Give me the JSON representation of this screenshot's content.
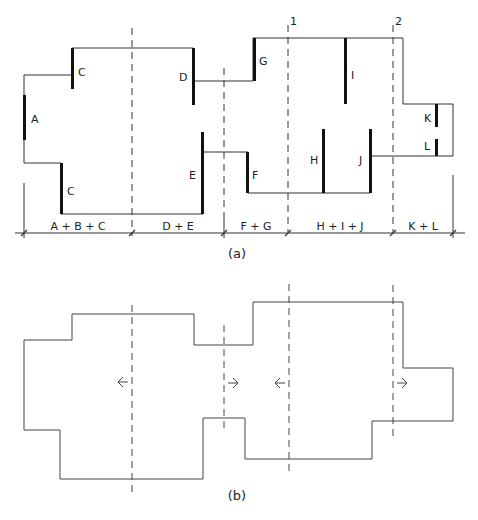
{
  "figure_a": {
    "caption": "(a)",
    "wall_labels": {
      "A": "A",
      "C1": "C",
      "C2": "C",
      "D": "D",
      "E": "E",
      "F": "F",
      "G": "G",
      "H": "H",
      "I": "I",
      "J": "J",
      "K": "K",
      "L": "L"
    },
    "axis_labels": {
      "axis1": "1",
      "axis2": "2"
    },
    "dimension_segments": [
      "A + B + C",
      "D + E",
      "F + G",
      "H + I + J",
      "K + L"
    ]
  },
  "figure_b": {
    "caption": "(b)",
    "arrows": [
      "left",
      "right",
      "left",
      "right"
    ]
  },
  "colors": {
    "line": "#333333",
    "wall": "#111111",
    "background": "#ffffff"
  }
}
